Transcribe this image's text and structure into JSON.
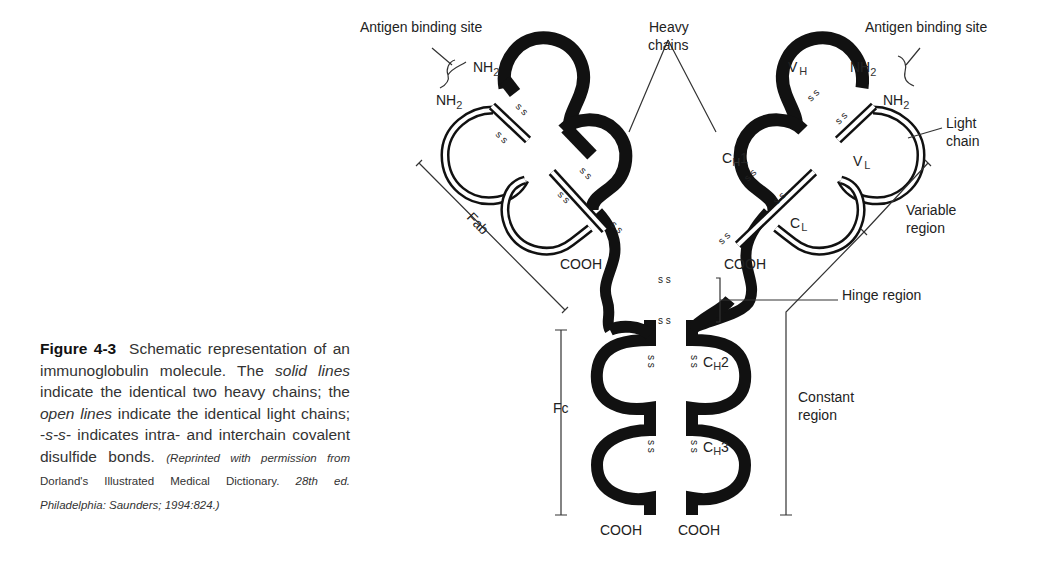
{
  "figure": {
    "number": "Figure 4-3",
    "caption_parts": {
      "lead": "Schematic representation of an immunoglobulin molecule. The ",
      "solid_lines": "solid lines",
      "mid1": " indicate the identical two heavy chains; the ",
      "open_lines": "open lines",
      "mid2": " indicate the identical light chains; -",
      "ss": "s-s-",
      "mid3": " indicates intra- and interchain covalent disulfide bonds. ",
      "source_a": "(Reprinted with permission from ",
      "source_b": "Dorland's Illustrated Medical Dictionary. ",
      "source_c": "28th ed. Philadelphia: Saunders; 1994:824.)"
    }
  },
  "labels": {
    "antigen_left": "Antigen binding site",
    "antigen_right": "Antigen binding site",
    "heavy_chains_1": "Heavy",
    "heavy_chains_2": "chains",
    "light_chain_1": "Light",
    "light_chain_2": "chain",
    "variable_1": "Variable",
    "variable_2": "region",
    "hinge": "Hinge region",
    "constant_1": "Constant",
    "constant_2": "region",
    "fab": "Fab",
    "fc": "Fc",
    "nh2": "NH",
    "sub2": "2",
    "cooh": "COOH",
    "vh": "V",
    "vh_sub": "H",
    "vl": "V",
    "vl_sub": "L",
    "ch1": "C",
    "ch1_sub": "H",
    "ch1_num": "1",
    "cl": "C",
    "cl_sub": "L",
    "ch2": "C",
    "ch2_sub": "H",
    "ch2_num": "2",
    "ch3": "C",
    "ch3_sub": "H",
    "ch3_num": "3",
    "ss": "s s"
  }
}
